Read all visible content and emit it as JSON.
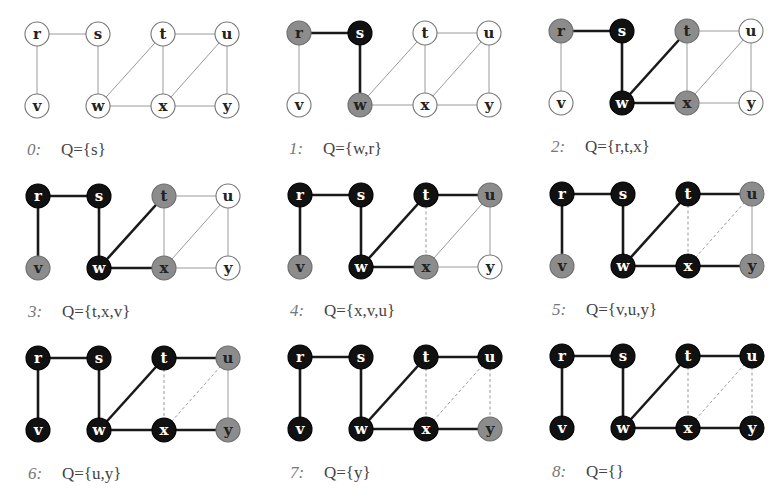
{
  "figure": {
    "colors": {
      "white_fill": "#ffffff",
      "gray_fill": "#8c8c8c",
      "black_fill": "#111111",
      "edge_default": "#9a9a9a",
      "edge_tree": "#1a1a1a",
      "edge_dashed": "#9a9a9a",
      "label_on_white": "#222222",
      "label_on_gray": "#222222",
      "label_on_black": "#ffffff"
    },
    "nodes": [
      {
        "id": "r",
        "dx": 0,
        "dy": 0
      },
      {
        "id": "s",
        "dx": 61,
        "dy": 0
      },
      {
        "id": "t",
        "dx": 126,
        "dy": 0
      },
      {
        "id": "u",
        "dx": 190,
        "dy": 0
      },
      {
        "id": "v",
        "dx": 0,
        "dy": 72
      },
      {
        "id": "w",
        "dx": 61,
        "dy": 72
      },
      {
        "id": "x",
        "dx": 126,
        "dy": 72
      },
      {
        "id": "y",
        "dx": 190,
        "dy": 72
      }
    ],
    "edges": [
      [
        "r",
        "s"
      ],
      [
        "r",
        "v"
      ],
      [
        "s",
        "w"
      ],
      [
        "w",
        "t"
      ],
      [
        "w",
        "x"
      ],
      [
        "t",
        "x"
      ],
      [
        "t",
        "u"
      ],
      [
        "x",
        "u"
      ],
      [
        "x",
        "y"
      ],
      [
        "u",
        "y"
      ]
    ],
    "panels": [
      {
        "step": "0:",
        "queue": "Q={s}",
        "ox": 37,
        "oy": 34,
        "gray": [],
        "black": [],
        "tree": [],
        "dashed": []
      },
      {
        "step": "1:",
        "queue": "Q={w,r}",
        "ox": 299,
        "oy": 33,
        "gray": [
          "r",
          "w"
        ],
        "black": [
          "s"
        ],
        "tree": [
          [
            "r",
            "s"
          ],
          [
            "s",
            "w"
          ]
        ],
        "dashed": []
      },
      {
        "step": "2:",
        "queue": "Q={r,t,x}",
        "ox": 561,
        "oy": 31,
        "gray": [
          "r",
          "t",
          "x"
        ],
        "black": [
          "s",
          "w"
        ],
        "tree": [
          [
            "r",
            "s"
          ],
          [
            "s",
            "w"
          ],
          [
            "w",
            "t"
          ],
          [
            "w",
            "x"
          ]
        ],
        "dashed": []
      },
      {
        "step": "3:",
        "queue": "Q={t,x,v}",
        "ox": 38,
        "oy": 196,
        "gray": [
          "t",
          "x",
          "v"
        ],
        "black": [
          "r",
          "s",
          "w"
        ],
        "tree": [
          [
            "r",
            "s"
          ],
          [
            "s",
            "w"
          ],
          [
            "w",
            "t"
          ],
          [
            "w",
            "x"
          ],
          [
            "r",
            "v"
          ]
        ],
        "dashed": []
      },
      {
        "step": "4:",
        "queue": "Q={x,v,u}",
        "ox": 300,
        "oy": 195,
        "gray": [
          "x",
          "v",
          "u"
        ],
        "black": [
          "r",
          "s",
          "w",
          "t"
        ],
        "tree": [
          [
            "r",
            "s"
          ],
          [
            "s",
            "w"
          ],
          [
            "w",
            "t"
          ],
          [
            "w",
            "x"
          ],
          [
            "r",
            "v"
          ],
          [
            "t",
            "u"
          ]
        ],
        "dashed": [
          [
            "t",
            "x"
          ]
        ]
      },
      {
        "step": "5:",
        "queue": "Q={v,u,y}",
        "ox": 562,
        "oy": 194,
        "gray": [
          "v",
          "u",
          "y"
        ],
        "black": [
          "r",
          "s",
          "w",
          "t",
          "x"
        ],
        "tree": [
          [
            "r",
            "s"
          ],
          [
            "s",
            "w"
          ],
          [
            "w",
            "t"
          ],
          [
            "w",
            "x"
          ],
          [
            "r",
            "v"
          ],
          [
            "t",
            "u"
          ],
          [
            "x",
            "y"
          ]
        ],
        "dashed": [
          [
            "t",
            "x"
          ],
          [
            "x",
            "u"
          ]
        ]
      },
      {
        "step": "6:",
        "queue": "Q={u,y}",
        "ox": 38,
        "oy": 358,
        "gray": [
          "u",
          "y"
        ],
        "black": [
          "r",
          "s",
          "w",
          "t",
          "x",
          "v"
        ],
        "tree": [
          [
            "r",
            "s"
          ],
          [
            "s",
            "w"
          ],
          [
            "w",
            "t"
          ],
          [
            "w",
            "x"
          ],
          [
            "r",
            "v"
          ],
          [
            "t",
            "u"
          ],
          [
            "x",
            "y"
          ]
        ],
        "dashed": [
          [
            "t",
            "x"
          ],
          [
            "x",
            "u"
          ]
        ]
      },
      {
        "step": "7:",
        "queue": "Q={y}",
        "ox": 300,
        "oy": 357,
        "gray": [
          "y"
        ],
        "black": [
          "r",
          "s",
          "w",
          "t",
          "x",
          "v",
          "u"
        ],
        "tree": [
          [
            "r",
            "s"
          ],
          [
            "s",
            "w"
          ],
          [
            "w",
            "t"
          ],
          [
            "w",
            "x"
          ],
          [
            "r",
            "v"
          ],
          [
            "t",
            "u"
          ],
          [
            "x",
            "y"
          ]
        ],
        "dashed": [
          [
            "t",
            "x"
          ],
          [
            "x",
            "u"
          ],
          [
            "u",
            "y"
          ]
        ]
      },
      {
        "step": "8:",
        "queue": "Q={}",
        "ox": 562,
        "oy": 356,
        "gray": [],
        "black": [
          "r",
          "s",
          "w",
          "t",
          "x",
          "v",
          "u",
          "y"
        ],
        "tree": [
          [
            "r",
            "s"
          ],
          [
            "s",
            "w"
          ],
          [
            "w",
            "t"
          ],
          [
            "w",
            "x"
          ],
          [
            "r",
            "v"
          ],
          [
            "t",
            "u"
          ],
          [
            "x",
            "y"
          ]
        ],
        "dashed": [
          [
            "t",
            "x"
          ],
          [
            "x",
            "u"
          ],
          [
            "u",
            "y"
          ]
        ]
      }
    ]
  }
}
